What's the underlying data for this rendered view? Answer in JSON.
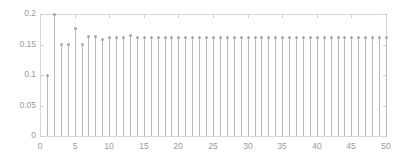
{
  "chart_data": {
    "type": "scatter",
    "plot_style": "stem",
    "title": "",
    "subtitle": "",
    "xlabel": "",
    "ylabel": "",
    "xlim": [
      0,
      50
    ],
    "ylim": [
      0,
      0.2
    ],
    "grid": false,
    "legend": null,
    "xticks": [
      0,
      5,
      10,
      15,
      20,
      25,
      30,
      35,
      40,
      45,
      50
    ],
    "xtick_labels": [
      "0",
      "5",
      "10",
      "15",
      "20",
      "25",
      "30",
      "35",
      "40",
      "45",
      "50"
    ],
    "yticks": [
      0,
      0.05,
      0.1,
      0.15,
      0.2
    ],
    "ytick_labels": [
      "0",
      "0.05",
      "0.1",
      "0.15",
      "0.2"
    ],
    "x": [
      1,
      2,
      3,
      4,
      5,
      6,
      7,
      8,
      9,
      10,
      11,
      12,
      13,
      14,
      15,
      16,
      17,
      18,
      19,
      20,
      21,
      22,
      23,
      24,
      25,
      26,
      27,
      28,
      29,
      30,
      31,
      32,
      33,
      34,
      35,
      36,
      37,
      38,
      39,
      40,
      41,
      42,
      43,
      44,
      45,
      46,
      47,
      48,
      49,
      50
    ],
    "values": [
      0.1,
      0.2,
      0.15,
      0.15,
      0.176,
      0.15,
      0.163,
      0.163,
      0.158,
      0.162,
      0.162,
      0.162,
      0.165,
      0.161,
      0.161,
      0.162,
      0.161,
      0.161,
      0.161,
      0.161,
      0.161,
      0.161,
      0.161,
      0.161,
      0.161,
      0.161,
      0.161,
      0.161,
      0.161,
      0.161,
      0.161,
      0.161,
      0.161,
      0.161,
      0.161,
      0.161,
      0.161,
      0.161,
      0.161,
      0.161,
      0.161,
      0.161,
      0.161,
      0.161,
      0.161,
      0.161,
      0.161,
      0.161,
      0.161,
      0.161
    ],
    "series_name": "",
    "colors": {
      "stem": "#b9b9b9",
      "marker": "#a8a8a8",
      "axis": "#d8d8d8",
      "tick_label": "#9a9a9a",
      "background": "#ffffff"
    }
  }
}
